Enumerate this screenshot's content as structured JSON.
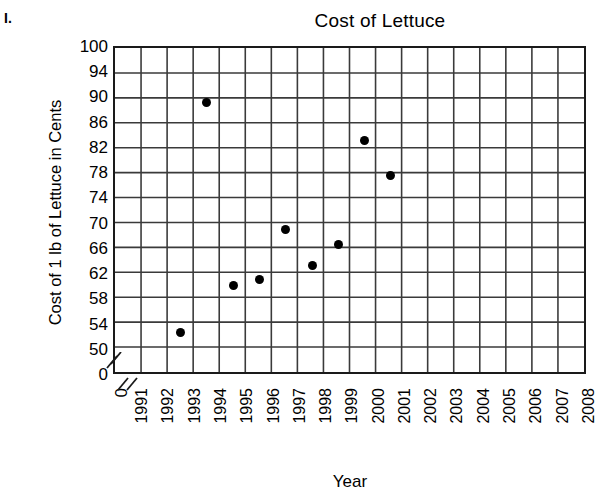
{
  "item_label": "I.",
  "chart_data": {
    "type": "scatter",
    "title": "Cost of Lettuce",
    "xlabel": "Year",
    "ylabel": "Cost of 1 lb of Lettuce in Cents",
    "grid": true,
    "legend": "none",
    "marker_color": "#000000",
    "axis_color": "#1a1a1a",
    "grid_color": "#3a3a3a",
    "axis_break": true,
    "x_tick_labels": [
      "0",
      "1991",
      "1992",
      "1993",
      "1994",
      "1995",
      "1996",
      "1997",
      "1998",
      "1999",
      "2000",
      "2001",
      "2002",
      "2003",
      "2004",
      "2005",
      "2006",
      "2007",
      "2008"
    ],
    "y_tick_labels": [
      "100",
      "94",
      "90",
      "86",
      "82",
      "78",
      "74",
      "70",
      "66",
      "62",
      "58",
      "54",
      "50",
      "0"
    ],
    "ylim": [
      50,
      100
    ],
    "xlim": [
      1991,
      2008
    ],
    "categories": [
      1991,
      1992,
      1993,
      1994,
      1995,
      1996,
      1997,
      1998,
      1999,
      2000,
      2001,
      2002,
      2003,
      2004,
      2005,
      2006,
      2007,
      2008
    ],
    "points": [
      {
        "x": 1993,
        "y": 53
      },
      {
        "x": 1994,
        "y": 91
      },
      {
        "x": 1995,
        "y": 60.8
      },
      {
        "x": 1996,
        "y": 61.8
      },
      {
        "x": 1997,
        "y": 70
      },
      {
        "x": 1998,
        "y": 64
      },
      {
        "x": 1999,
        "y": 67.5
      },
      {
        "x": 2000,
        "y": 84.7
      },
      {
        "x": 2001,
        "y": 79
      }
    ]
  }
}
